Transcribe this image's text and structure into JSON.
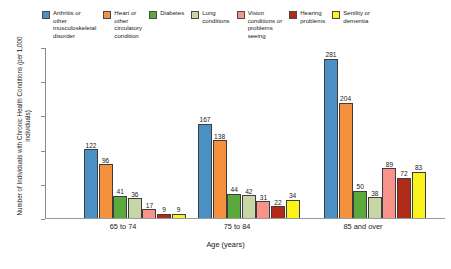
{
  "chart_data": {
    "type": "bar",
    "title": "",
    "xlabel": "Age (years)",
    "ylabel": "Number of Individuals with Chronic Health Conditions\n(per 1,000 individuals)",
    "categories": [
      "65 to 74",
      "75 to 84",
      "85 and over"
    ],
    "series": [
      {
        "name": "Arthritis or other musculoskeletal disorder",
        "color": "#4a90c4",
        "values": [
          122,
          167,
          281
        ]
      },
      {
        "name": "Heart or other circulatory condition",
        "color": "#f3913f",
        "values": [
          96,
          138,
          204
        ]
      },
      {
        "name": "Diabetes",
        "color": "#5ba83c",
        "values": [
          41,
          44,
          50
        ]
      },
      {
        "name": "Lung conditions",
        "color": "#c7d6a5",
        "values": [
          36,
          42,
          38
        ]
      },
      {
        "name": "Vision conditions or problems seeing",
        "color": "#f7938b",
        "values": [
          17,
          31,
          89
        ]
      },
      {
        "name": "Hearing problems",
        "color": "#b12b19",
        "values": [
          9,
          22,
          72
        ]
      },
      {
        "name": "Senility or dementia",
        "color": "#fbf21a",
        "values": [
          9,
          34,
          83
        ]
      }
    ],
    "ylim": [
      0,
      300
    ],
    "y_tick_count": 6,
    "y_tick_labels_shown": false,
    "grid": false,
    "legend_position": "top",
    "bar_border_color": "#3d3d3d",
    "axis_color": "#8a8a8a"
  },
  "legend": {
    "items": [
      {
        "label": "Arthritis or\nother\nmusculoskeletal\ndisorder",
        "color": "#4a90c4",
        "key": "arthritis"
      },
      {
        "label": "Heart or\nother\ncirculatory\ncondition",
        "color": "#f3913f",
        "key": "heart"
      },
      {
        "label": "Diabetes",
        "color": "#5ba83c",
        "key": "diabetes"
      },
      {
        "label": "Lung\nconditions",
        "color": "#c7d6a5",
        "key": "lung"
      },
      {
        "label": "Vision\nconditions or\nproblems\nseeing",
        "color": "#f7938b",
        "key": "vision"
      },
      {
        "label": "Hearing\nproblems",
        "color": "#b12b19",
        "key": "hearing"
      },
      {
        "label": "Senility or\ndementia",
        "color": "#fbf21a",
        "key": "senility"
      }
    ]
  },
  "axes": {
    "y_title": "Number of Individuals with Chronic Health Conditions\n(per 1,000 individuals)",
    "x_title": "Age (years)",
    "x_tick_labels": [
      "65 to 74",
      "75 to 84",
      "85 and over"
    ]
  }
}
